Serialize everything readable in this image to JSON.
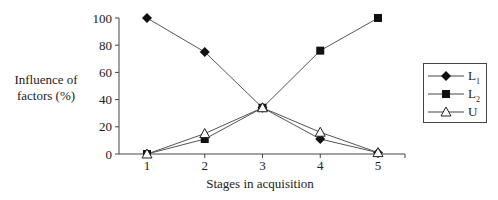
{
  "chart_data": {
    "type": "line",
    "title": "",
    "xlabel": "Stages in acquisition",
    "ylabel": "Influence of factors (%)",
    "ylabel_lines": [
      "Influence of",
      "factors (%)"
    ],
    "x": [
      1,
      2,
      3,
      4,
      5
    ],
    "ylim": [
      0,
      100
    ],
    "yticks": [
      0,
      20,
      40,
      60,
      80,
      100
    ],
    "grid": false,
    "legend_position": "right",
    "series": [
      {
        "name": "L1",
        "label_main": "L",
        "label_sub": "1",
        "marker": "diamond-filled",
        "values": [
          100,
          75,
          34,
          11,
          1
        ]
      },
      {
        "name": "L2",
        "label_main": "L",
        "label_sub": "2",
        "marker": "square-filled",
        "values": [
          0,
          11,
          34,
          76,
          100
        ]
      },
      {
        "name": "U",
        "label_main": "U",
        "label_sub": "",
        "marker": "triangle-open",
        "values": [
          0,
          15,
          34,
          16,
          1
        ]
      }
    ]
  }
}
